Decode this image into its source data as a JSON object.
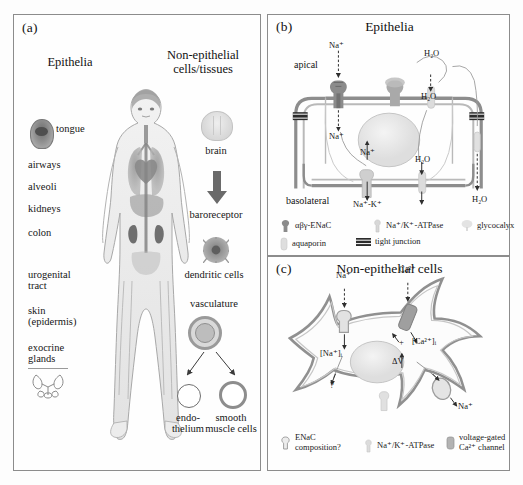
{
  "figure": {
    "panels": {
      "a": {
        "tag": "(a)",
        "columns": {
          "left_head": "Epithelia",
          "right_head_line1": "Non-epithelial",
          "right_head_line2": "cells/tissues"
        },
        "epithelia_items": [
          "tongue",
          "airways",
          "alveoli",
          "kidneys",
          "colon",
          "urogenital",
          "tract",
          "skin",
          "(epidermis)",
          "exocrine",
          "glands"
        ],
        "non_epithelial_items": [
          "brain",
          "baroreceptor",
          "dendritic cells",
          "vasculature",
          "endo-",
          "thelium",
          "smooth",
          "muscle cells"
        ]
      },
      "b": {
        "tag": "(b)",
        "title": "Epithelia",
        "surface_labels": {
          "apical": "apical",
          "basolateral": "basolateral"
        },
        "ion_labels": [
          "Na⁺",
          "Na⁺",
          "H₂O",
          "H₂O",
          "Na⁺",
          "Na⁺-K⁺",
          "H₂O",
          "H₂O"
        ],
        "legend": [
          {
            "icon": "enac-icon",
            "label": "αβγ-ENaC"
          },
          {
            "icon": "atpase-icon",
            "label": "Na⁺/K⁺-ATPase"
          },
          {
            "icon": "glycocalyx-icon",
            "label": "glycocalyx"
          },
          {
            "icon": "aquaporin-icon",
            "label": "aquaporin"
          },
          {
            "icon": "tight-junction-icon",
            "label": "tight junction"
          }
        ]
      },
      "c": {
        "tag": "(c)",
        "title": "Non-epithelial cells",
        "ion_labels": [
          "Na⁺",
          "Ca²⁺",
          "[Na⁺]ᵢ",
          "[Ca²⁺]ᵢ",
          "ΔV",
          "Na⁺",
          "+",
          "?"
        ],
        "legend": [
          {
            "icon": "enac-icon",
            "label_line1": "ENaC",
            "label_line2": "composition?"
          },
          {
            "icon": "atpase-icon",
            "label_line1": "Na⁺/K⁺-ATPase",
            "label_line2": ""
          },
          {
            "icon": "vgcc-icon",
            "label_line1": "voltage-gated",
            "label_line2": "Ca²⁺ channel"
          }
        ]
      }
    },
    "colors": {
      "frame": "#8c8c8c",
      "membrane": "#8f8f8f",
      "membrane_dark": "#6f6f6f",
      "channel": "#7f7f7f",
      "nucleus": "#e6e6e6",
      "text": "#141414"
    }
  }
}
